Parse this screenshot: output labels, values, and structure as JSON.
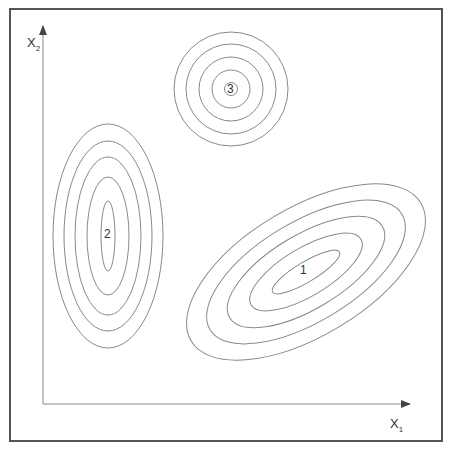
{
  "diagram": {
    "title": "",
    "axes": {
      "x_label": "X",
      "x_sub": "1",
      "y_label": "X",
      "y_sub": "2"
    },
    "clusters": [
      {
        "id": "1",
        "label": "1",
        "shape": "tilted-ellipse",
        "contours": 5
      },
      {
        "id": "2",
        "label": "2",
        "shape": "vertical-ellipse",
        "contours": 5
      },
      {
        "id": "3",
        "label": "3",
        "shape": "circle",
        "contours": 5
      }
    ],
    "colors": {
      "line": "#888888",
      "axis": "#777777",
      "frame": "#555555",
      "text": "#333333"
    }
  }
}
